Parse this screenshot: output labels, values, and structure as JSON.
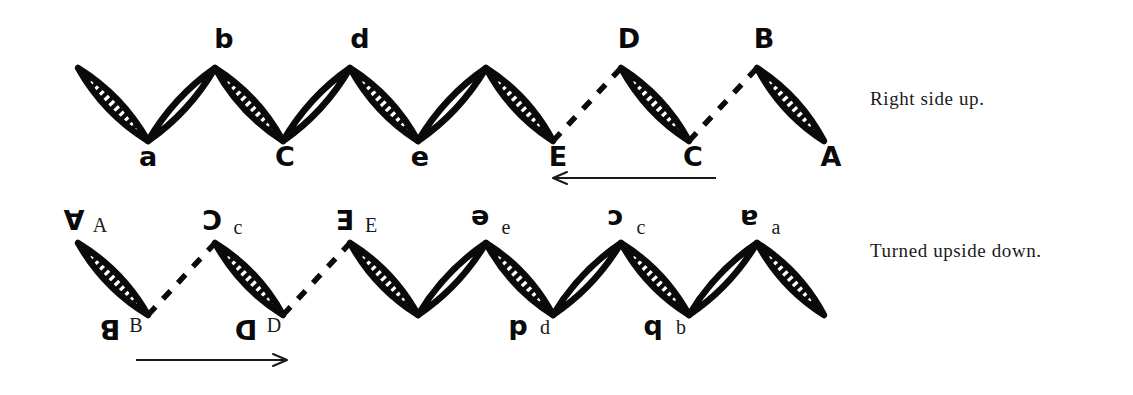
{
  "figure": {
    "background_color": "#ffffff",
    "ink_color": "#0a0a0a",
    "caption_top": "Right side up.",
    "caption_bottom": "Turned upside down."
  },
  "rows": {
    "top": {
      "name": "right-side-up-chain",
      "direction_arrow": "left",
      "peak_y": 68,
      "valley_y": 141,
      "vertices_x": [
        78,
        148,
        215,
        283,
        350,
        418,
        486,
        553,
        621,
        689,
        757,
        824
      ],
      "labels": [
        {
          "text": "a",
          "style": "hand-lower",
          "x": 148,
          "y": 166
        },
        {
          "text": "b",
          "style": "hand-lower",
          "x": 224,
          "y": 48
        },
        {
          "text": "C",
          "style": "hand-upper",
          "x": 285,
          "y": 166
        },
        {
          "text": "d",
          "style": "hand-lower",
          "x": 360,
          "y": 48
        },
        {
          "text": "e",
          "style": "hand-lower",
          "x": 420,
          "y": 166
        },
        {
          "text": "E",
          "style": "hand-upper",
          "x": 558,
          "y": 166
        },
        {
          "text": "D",
          "style": "hand-upper",
          "x": 629,
          "y": 48
        },
        {
          "text": "C",
          "style": "hand-upper",
          "x": 693,
          "y": 166
        },
        {
          "text": "B",
          "style": "hand-upper",
          "x": 764,
          "y": 48
        },
        {
          "text": "A",
          "style": "hand-upper",
          "x": 831,
          "y": 166
        }
      ]
    },
    "bottom": {
      "name": "upside-down-chain",
      "direction_arrow": "right",
      "peak_y": 243,
      "valley_y": 315,
      "vertices_x": [
        78,
        148,
        215,
        283,
        350,
        418,
        486,
        553,
        621,
        689,
        757,
        824
      ],
      "labels": [
        {
          "text": "A",
          "style": "hand-rot",
          "x": 74,
          "y": 228
        },
        {
          "text": "A",
          "style": "type-upper",
          "x": 100,
          "y": 232
        },
        {
          "text": "B",
          "style": "hand-rot",
          "x": 110,
          "y": 338
        },
        {
          "text": "B",
          "style": "type-upper",
          "x": 136,
          "y": 332
        },
        {
          "text": "C",
          "style": "hand-rot",
          "x": 212,
          "y": 228
        },
        {
          "text": "c",
          "style": "type-lower",
          "x": 238,
          "y": 234
        },
        {
          "text": "D",
          "style": "hand-rot",
          "x": 246,
          "y": 338
        },
        {
          "text": "D",
          "style": "type-upper",
          "x": 274,
          "y": 332
        },
        {
          "text": "E",
          "style": "hand-rot",
          "x": 345,
          "y": 228
        },
        {
          "text": "E",
          "style": "type-upper",
          "x": 371,
          "y": 232
        },
        {
          "text": "e",
          "style": "hand-rot",
          "x": 480,
          "y": 228
        },
        {
          "text": "e",
          "style": "type-lower",
          "x": 506,
          "y": 234
        },
        {
          "text": "d",
          "style": "hand-rot",
          "x": 518,
          "y": 338
        },
        {
          "text": "d",
          "style": "type-lower",
          "x": 545,
          "y": 334
        },
        {
          "text": "c",
          "style": "hand-rot",
          "x": 615,
          "y": 228
        },
        {
          "text": "c",
          "style": "type-lower",
          "x": 641,
          "y": 234
        },
        {
          "text": "b",
          "style": "hand-rot",
          "x": 653,
          "y": 338
        },
        {
          "text": "b",
          "style": "type-lower",
          "x": 681,
          "y": 334
        },
        {
          "text": "a",
          "style": "hand-rot",
          "x": 749,
          "y": 228
        },
        {
          "text": "a",
          "style": "type-lower",
          "x": 776,
          "y": 234
        }
      ]
    }
  },
  "segments": {
    "top": [
      {
        "from": 0,
        "to": 1,
        "kind": "lens-hatched",
        "slope": "down"
      },
      {
        "from": 1,
        "to": 2,
        "kind": "lens-plain",
        "slope": "up"
      },
      {
        "from": 2,
        "to": 3,
        "kind": "lens-hatched",
        "slope": "down"
      },
      {
        "from": 3,
        "to": 4,
        "kind": "lens-plain",
        "slope": "up"
      },
      {
        "from": 4,
        "to": 5,
        "kind": "lens-hatched",
        "slope": "down"
      },
      {
        "from": 5,
        "to": 6,
        "kind": "lens-plain",
        "slope": "up"
      },
      {
        "from": 6,
        "to": 7,
        "kind": "lens-hatched",
        "slope": "down"
      },
      {
        "from": 7,
        "to": 8,
        "kind": "dashed",
        "slope": "up"
      },
      {
        "from": 8,
        "to": 9,
        "kind": "lens-hatched",
        "slope": "down"
      },
      {
        "from": 9,
        "to": 10,
        "kind": "dashed",
        "slope": "up"
      },
      {
        "from": 10,
        "to": 11,
        "kind": "lens-hatched",
        "slope": "down"
      }
    ],
    "bottom": [
      {
        "from": 0,
        "to": 1,
        "kind": "lens-hatched",
        "slope": "down"
      },
      {
        "from": 1,
        "to": 2,
        "kind": "dashed",
        "slope": "up"
      },
      {
        "from": 2,
        "to": 3,
        "kind": "lens-hatched",
        "slope": "down"
      },
      {
        "from": 3,
        "to": 4,
        "kind": "dashed",
        "slope": "up"
      },
      {
        "from": 4,
        "to": 5,
        "kind": "lens-hatched",
        "slope": "down"
      },
      {
        "from": 5,
        "to": 6,
        "kind": "lens-plain",
        "slope": "up"
      },
      {
        "from": 6,
        "to": 7,
        "kind": "lens-hatched",
        "slope": "down"
      },
      {
        "from": 7,
        "to": 8,
        "kind": "lens-plain",
        "slope": "up"
      },
      {
        "from": 8,
        "to": 9,
        "kind": "lens-hatched",
        "slope": "down"
      },
      {
        "from": 9,
        "to": 10,
        "kind": "lens-plain",
        "slope": "up"
      },
      {
        "from": 10,
        "to": 11,
        "kind": "lens-hatched",
        "slope": "down"
      }
    ]
  },
  "arrows": {
    "top": {
      "x1": 716,
      "y1": 178,
      "x2": 553,
      "y2": 178,
      "head": "left"
    },
    "bottom": {
      "x1": 136,
      "y1": 360,
      "x2": 287,
      "y2": 360,
      "head": "right"
    }
  }
}
